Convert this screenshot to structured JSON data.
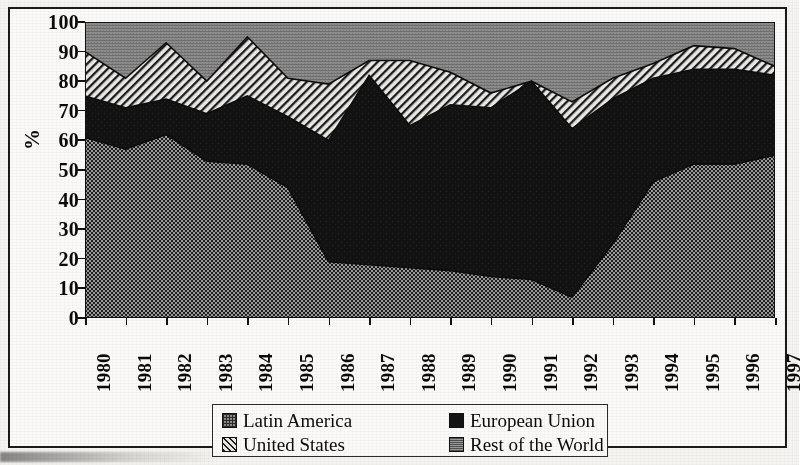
{
  "chart_data": {
    "type": "area",
    "stacked": true,
    "title": "",
    "subtitle": "",
    "xlabel": "",
    "ylabel": "%",
    "ylim": [
      0,
      100
    ],
    "ytick_step": 10,
    "yticks": [
      100,
      90,
      80,
      70,
      60,
      50,
      40,
      30,
      20,
      10,
      0
    ],
    "grid": false,
    "legend_position": "bottom-center",
    "categories": [
      "1980",
      "1981",
      "1982",
      "1983",
      "1984",
      "1985",
      "1986",
      "1987",
      "1988",
      "1989",
      "1990",
      "1991",
      "1992",
      "1993",
      "1994",
      "1995",
      "1996",
      "1997"
    ],
    "series": [
      {
        "name": "Latin America",
        "pattern": "checkered-dots",
        "color": "#8e8e8e",
        "values": [
          61,
          57,
          62,
          53,
          52,
          44,
          19,
          18,
          17,
          16,
          14,
          13,
          7,
          25,
          46,
          52,
          52,
          55
        ]
      },
      {
        "name": "European Union",
        "pattern": "solid-black",
        "color": "#141414",
        "values": [
          14,
          14,
          12,
          16,
          23,
          24,
          41,
          64,
          48,
          56,
          57,
          67,
          57,
          49,
          35,
          32,
          32,
          27
        ]
      },
      {
        "name": "United States",
        "pattern": "diagonal-hatch",
        "color": "#e9e7e3",
        "values": [
          15,
          10,
          19,
          11,
          20,
          13,
          19,
          5,
          22,
          11,
          5,
          0,
          9,
          7,
          5,
          8,
          7,
          3
        ]
      },
      {
        "name": "Rest of the World",
        "pattern": "gray-fill",
        "color": "#9a9a9a",
        "values": [
          10,
          19,
          7,
          20,
          5,
          19,
          21,
          13,
          13,
          17,
          24,
          20,
          27,
          19,
          14,
          8,
          9,
          15
        ]
      }
    ],
    "cumulative_boundaries": {
      "latin_america": [
        61,
        57,
        62,
        53,
        52,
        44,
        19,
        18,
        17,
        16,
        14,
        13,
        7,
        25,
        46,
        52,
        52,
        55
      ],
      "plus_european_union": [
        75,
        71,
        74,
        69,
        75,
        68,
        60,
        82,
        65,
        72,
        71,
        80,
        64,
        74,
        81,
        84,
        84,
        82
      ],
      "plus_united_states": [
        90,
        81,
        93,
        80,
        95,
        81,
        79,
        87,
        87,
        83,
        76,
        80,
        73,
        81,
        86,
        92,
        91,
        85
      ],
      "total": [
        100,
        100,
        100,
        100,
        100,
        100,
        100,
        100,
        100,
        100,
        100,
        100,
        100,
        100,
        100,
        100,
        100,
        100
      ]
    }
  },
  "axes": {
    "y_title": "%",
    "y_labels": [
      "100",
      "90",
      "80",
      "70",
      "60",
      "50",
      "40",
      "30",
      "20",
      "10",
      "0"
    ],
    "x_labels": [
      "1980",
      "1981",
      "1982",
      "1983",
      "1984",
      "1985",
      "1986",
      "1987",
      "1988",
      "1989",
      "1990",
      "1991",
      "1992",
      "1993",
      "1994",
      "1995",
      "1996",
      "1997"
    ]
  },
  "legend": {
    "entries": [
      {
        "label": "Latin America",
        "swatch": "latin-america-swatch-icon"
      },
      {
        "label": "European Union",
        "swatch": "european-union-swatch-icon"
      },
      {
        "label": "United States",
        "swatch": "united-states-swatch-icon"
      },
      {
        "label": "Rest of the World",
        "swatch": "rest-of-the-world-swatch-icon"
      }
    ]
  }
}
